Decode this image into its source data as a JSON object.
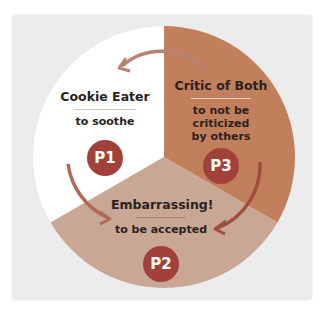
{
  "diagram": {
    "colors": {
      "background": "#ececec",
      "segment_p1": "#ffffff",
      "segment_p2": "#c6a593",
      "segment_p3": "#c07d5b",
      "badge": "#a2413a",
      "arrow": "#b06a55",
      "rule_light": "#e6d3c4",
      "rule_dark": "#8f6a55"
    },
    "segments": [
      {
        "id": "P1",
        "title": "Cookie Eater",
        "subtitle": "to soothe"
      },
      {
        "id": "P3",
        "title": "Critic of Both",
        "subtitle_line1": "to not be criticized",
        "subtitle_line2": "by others"
      },
      {
        "id": "P2",
        "title": "Embarrassing!",
        "subtitle": "to be accepted"
      }
    ]
  }
}
